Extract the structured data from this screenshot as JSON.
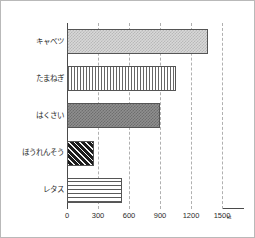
{
  "chart_data": {
    "type": "bar",
    "orientation": "horizontal",
    "title": "",
    "xlabel": "",
    "ylabel": "",
    "unit": "kt",
    "xlim": [
      0,
      1500
    ],
    "xticks": [
      0,
      300,
      600,
      900,
      1200,
      1500
    ],
    "xtick_labels": [
      "0",
      "300",
      "600",
      "900",
      "1200",
      "1500"
    ],
    "grid": true,
    "grid_axis": "x",
    "grid_style": "dashed",
    "legend": "none",
    "categories": [
      "キャベツ",
      "たまねぎ",
      "はくさい",
      "ほうれんそう",
      "レタス"
    ],
    "values": [
      1360,
      1050,
      900,
      265,
      530
    ],
    "bar_patterns": [
      "checker-light",
      "vertical-lines",
      "checker-dark",
      "diagonal-hatch",
      "horizontal-lines"
    ]
  },
  "colors": {
    "axis": "#4a4a4a",
    "grid": "#b0b0b0",
    "frame": "#b9b9b9",
    "text": "#2b2b2b",
    "background": "#ffffff"
  }
}
